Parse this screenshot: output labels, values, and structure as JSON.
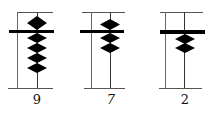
{
  "diagram": {
    "type": "abacus-columns",
    "colors": {
      "frame": "#555555",
      "bead": "#000000",
      "crossbar": "#000000",
      "background": "#ffffff"
    },
    "columns": [
      {
        "label": "9",
        "value": 9,
        "upper_beads_active": 1,
        "lower_beads_active": 4
      },
      {
        "label": "7",
        "value": 7,
        "upper_beads_active": 1,
        "lower_beads_active": 2
      },
      {
        "label": "2",
        "value": 2,
        "upper_beads_active": 0,
        "lower_beads_active": 2
      }
    ]
  }
}
